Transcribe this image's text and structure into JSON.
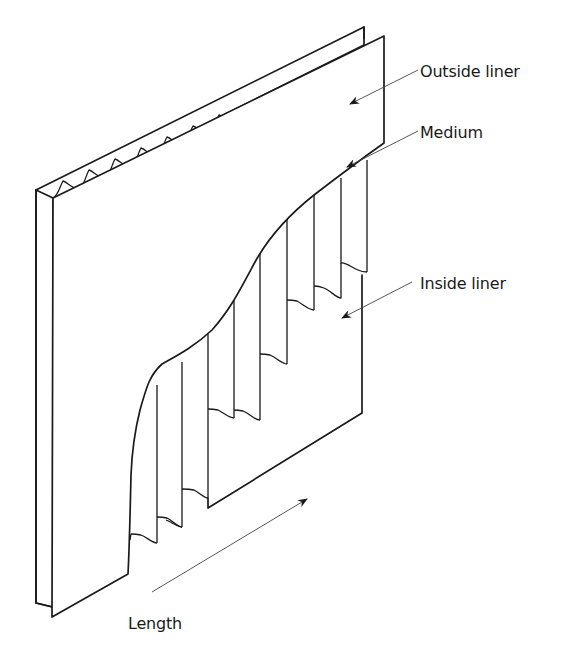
{
  "figure": {
    "labels": {
      "outside_liner": "Outside liner",
      "medium": "Medium",
      "inside_liner": "Inside liner",
      "length": "Length"
    },
    "colors": {
      "line": "#1a1a1a",
      "leader": "#444444",
      "background": "#ffffff"
    }
  }
}
